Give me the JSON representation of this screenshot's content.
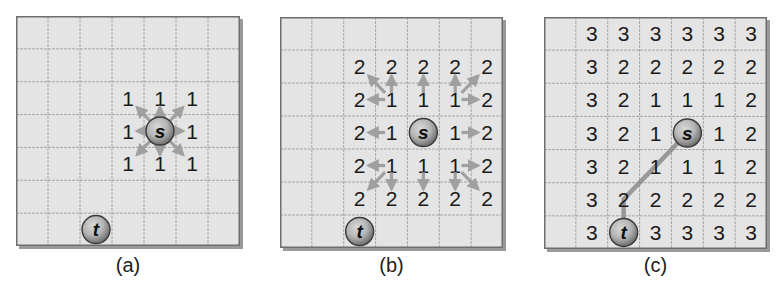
{
  "figure": {
    "colors": {
      "background": "#ffffff",
      "cell_fill": "#e4e4e4",
      "grid_line": "#a0a0a0",
      "border": "#6e6e6e",
      "shadow": "#9a9a9a",
      "arrow": "#9b9b9b",
      "path_line": "#8f8f8f",
      "number": "#1a1a1a",
      "node_fill_outer": "#6f6f6f",
      "node_fill_inner": "#b5b5b5"
    },
    "grid_size": {
      "rows": 7,
      "cols": 7
    },
    "caption_fragment": "",
    "panels": [
      {
        "id": "a",
        "label": "(a)",
        "box": {
          "x": 16,
          "y": 16,
          "w": 224,
          "h": 230
        },
        "source": {
          "label": "s",
          "row": 3,
          "col": 4
        },
        "target": {
          "label": "t",
          "row": 6,
          "col": 2
        },
        "cells": [
          [
            "",
            "",
            "",
            "",
            "",
            "",
            ""
          ],
          [
            "",
            "",
            "",
            "",
            "",
            "",
            ""
          ],
          [
            "",
            "",
            "",
            "1",
            "1",
            "1",
            ""
          ],
          [
            "",
            "",
            "",
            "1",
            "",
            "1",
            ""
          ],
          [
            "",
            "",
            "",
            "1",
            "1",
            "1",
            ""
          ],
          [
            "",
            "",
            "",
            "",
            "",
            "",
            ""
          ],
          [
            "",
            "",
            "",
            "",
            "",
            "",
            ""
          ]
        ],
        "arrows": [
          {
            "from": [
              3,
              4
            ],
            "to": [
              2,
              3
            ]
          },
          {
            "from": [
              3,
              4
            ],
            "to": [
              2,
              4
            ]
          },
          {
            "from": [
              3,
              4
            ],
            "to": [
              2,
              5
            ]
          },
          {
            "from": [
              3,
              4
            ],
            "to": [
              3,
              3
            ]
          },
          {
            "from": [
              3,
              4
            ],
            "to": [
              3,
              5
            ]
          },
          {
            "from": [
              3,
              4
            ],
            "to": [
              4,
              3
            ]
          },
          {
            "from": [
              3,
              4
            ],
            "to": [
              4,
              4
            ]
          },
          {
            "from": [
              3,
              4
            ],
            "to": [
              4,
              5
            ]
          }
        ],
        "path": []
      },
      {
        "id": "b",
        "label": "(b)",
        "box": {
          "x": 280,
          "y": 17,
          "w": 223,
          "h": 231
        },
        "source": {
          "label": "s",
          "row": 3,
          "col": 4
        },
        "target": {
          "label": "t",
          "row": 6,
          "col": 2
        },
        "cells": [
          [
            "",
            "",
            "",
            "",
            "",
            "",
            ""
          ],
          [
            "",
            "",
            "2",
            "2",
            "2",
            "2",
            "2"
          ],
          [
            "",
            "",
            "2",
            "1",
            "1",
            "1",
            "2"
          ],
          [
            "",
            "",
            "2",
            "1",
            "",
            "1",
            "2"
          ],
          [
            "",
            "",
            "2",
            "1",
            "1",
            "1",
            "2"
          ],
          [
            "",
            "",
            "2",
            "2",
            "2",
            "2",
            "2"
          ],
          [
            "",
            "",
            "",
            "",
            "",
            "",
            ""
          ]
        ],
        "arrows": [
          {
            "from": [
              2,
              3
            ],
            "to": [
              1,
              2
            ]
          },
          {
            "from": [
              2,
              3
            ],
            "to": [
              1,
              3
            ]
          },
          {
            "from": [
              2,
              3
            ],
            "to": [
              2,
              2
            ]
          },
          {
            "from": [
              2,
              4
            ],
            "to": [
              1,
              4
            ]
          },
          {
            "from": [
              2,
              5
            ],
            "to": [
              1,
              5
            ]
          },
          {
            "from": [
              2,
              5
            ],
            "to": [
              1,
              6
            ]
          },
          {
            "from": [
              2,
              5
            ],
            "to": [
              2,
              6
            ]
          },
          {
            "from": [
              3,
              3
            ],
            "to": [
              3,
              2
            ]
          },
          {
            "from": [
              3,
              5
            ],
            "to": [
              3,
              6
            ]
          },
          {
            "from": [
              4,
              3
            ],
            "to": [
              4,
              2
            ]
          },
          {
            "from": [
              4,
              3
            ],
            "to": [
              5,
              2
            ]
          },
          {
            "from": [
              4,
              3
            ],
            "to": [
              5,
              3
            ]
          },
          {
            "from": [
              4,
              4
            ],
            "to": [
              5,
              4
            ]
          },
          {
            "from": [
              4,
              5
            ],
            "to": [
              4,
              6
            ]
          },
          {
            "from": [
              4,
              5
            ],
            "to": [
              5,
              5
            ]
          },
          {
            "from": [
              4,
              5
            ],
            "to": [
              5,
              6
            ]
          }
        ],
        "path": []
      },
      {
        "id": "c",
        "label": "(c)",
        "box": {
          "x": 544,
          "y": 17,
          "w": 223,
          "h": 232
        },
        "source": {
          "label": "s",
          "row": 3,
          "col": 4
        },
        "target": {
          "label": "t",
          "row": 6,
          "col": 2
        },
        "cells": [
          [
            "",
            "3",
            "3",
            "3",
            "3",
            "3",
            "3"
          ],
          [
            "",
            "3",
            "2",
            "2",
            "2",
            "2",
            "2"
          ],
          [
            "",
            "3",
            "2",
            "1",
            "1",
            "1",
            "2"
          ],
          [
            "",
            "3",
            "2",
            "1",
            "",
            "1",
            "2"
          ],
          [
            "",
            "3",
            "2",
            "1",
            "1",
            "1",
            "2"
          ],
          [
            "",
            "3",
            "2",
            "2",
            "2",
            "2",
            "2"
          ],
          [
            "",
            "3",
            "",
            "3",
            "3",
            "3",
            "3"
          ]
        ],
        "arrows": [],
        "path": [
          [
            3,
            4
          ],
          [
            4,
            3
          ],
          [
            5,
            2
          ],
          [
            6,
            2
          ]
        ]
      }
    ]
  }
}
